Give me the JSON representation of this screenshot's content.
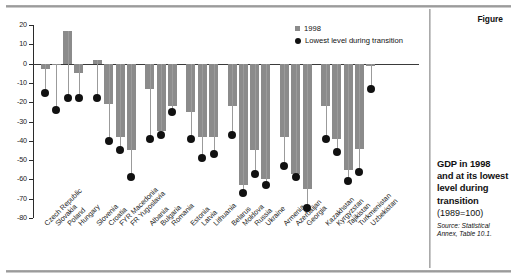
{
  "figure": {
    "label": "Figure",
    "caption_title": "GDP in 1998 and at its lowest level during transition",
    "caption_sub": "(1989=100)",
    "source_line1": "Source: Statistical",
    "source_line2": "Annex, Table 10.1."
  },
  "legend": {
    "series1_label": "1998",
    "series2_label": "Lowest level during transition",
    "series1_color": "#8b8b8b",
    "series2_color": "#111111"
  },
  "chart_data": {
    "type": "bar",
    "title": "GDP in 1998 and at its lowest level during transition",
    "subtitle": "(1989=100)",
    "xlabel": "",
    "ylabel": "",
    "ylim": [
      -80,
      20
    ],
    "yticks": [
      20,
      10,
      0,
      -10,
      -20,
      -30,
      -40,
      -50,
      -60,
      -70,
      -80
    ],
    "ytick_labels": [
      "20",
      "10",
      "0",
      "-10",
      "-20",
      "-30",
      "-40",
      "-50",
      "-60",
      "-70",
      "-80"
    ],
    "grid": false,
    "legend_position": "top-right",
    "groups": [
      {
        "name": "Central Europe",
        "countries": [
          "Czech Republic",
          "Slovakia",
          "Poland",
          "Hungary"
        ]
      },
      {
        "name": "South-eastern Europe I",
        "countries": [
          "Slovenia",
          "Croatia",
          "FYR Macedonia",
          "FR Yugoslavia"
        ]
      },
      {
        "name": "South-eastern Europe II",
        "countries": [
          "Albania",
          "Bulgaria",
          "Romania"
        ]
      },
      {
        "name": "Baltics",
        "countries": [
          "Estonia",
          "Latvia",
          "Lithuania"
        ]
      },
      {
        "name": "Western CIS",
        "countries": [
          "Belarus",
          "Moldova",
          "Russia",
          "Ukraine"
        ]
      },
      {
        "name": "Caucasus",
        "countries": [
          "Armenia",
          "Azerbaijan",
          "Georgia"
        ]
      },
      {
        "name": "Central Asia",
        "countries": [
          "Kazakhstan",
          "Kyrgyzstan",
          "Tajikistan",
          "Turkmenistan",
          "Uzbekistan"
        ]
      }
    ],
    "categories": [
      "Czech Republic",
      "Slovakia",
      "Poland",
      "Hungary",
      "Slovenia",
      "Croatia",
      "FYR Macedonia",
      "FR Yugoslavia",
      "Albania",
      "Bulgaria",
      "Romania",
      "Estonia",
      "Latvia",
      "Lithuania",
      "Belarus",
      "Moldova",
      "Russia",
      "Ukraine",
      "Armenia",
      "Azerbaijan",
      "Georgia",
      "Kazakhstan",
      "Kyrgyzstan",
      "Tajikistan",
      "Turkmenistan",
      "Uzbekistan"
    ],
    "series": [
      {
        "name": "1998",
        "color": "#8b8b8b",
        "values": [
          -3,
          0,
          17,
          -5,
          2,
          -21,
          -38,
          -45,
          -13,
          -35,
          -22,
          -25,
          -38,
          -38,
          -22,
          -63,
          -45,
          -60,
          -38,
          -57,
          -65,
          -22,
          -39,
          -55,
          -44,
          -1
        ]
      },
      {
        "name": "Lowest level during transition",
        "color": "#111111",
        "values": [
          -15,
          -24,
          -18,
          -18,
          -18,
          -40,
          -45,
          -59,
          -39,
          -37,
          -25,
          -39,
          -49,
          -47,
          -37,
          -67,
          -57,
          -63,
          -53,
          -59,
          -75,
          -39,
          -46,
          -61,
          -56,
          -13
        ]
      }
    ]
  }
}
